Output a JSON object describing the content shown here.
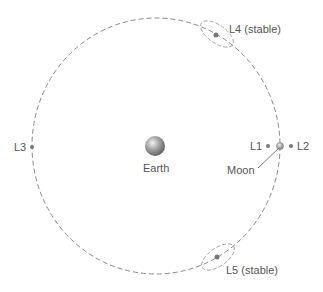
{
  "bodies": {
    "earth": "Earth",
    "moon": "Moon"
  },
  "points": {
    "L1": "L1",
    "L2": "L2",
    "L3": "L3",
    "L4": "L4 (stable)",
    "L5": "L5 (stable)"
  },
  "colors": {
    "orbit": "#888888",
    "point": "#777777",
    "text": "#555555"
  }
}
